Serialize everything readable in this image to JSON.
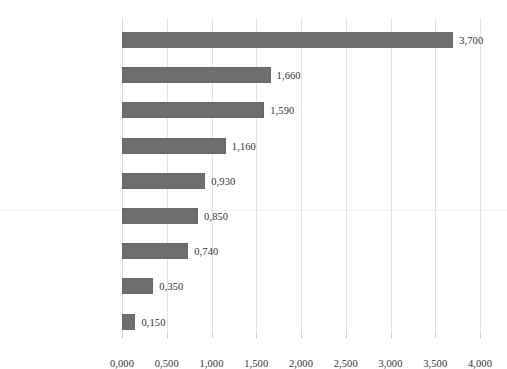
{
  "chart_data": {
    "type": "bar",
    "orientation": "horizontal",
    "title": "",
    "subtitle": "",
    "xlabel": "",
    "ylabel": "",
    "categories": [
      "Factories",
      "Cities",
      "Human",
      "Retail environments",
      "Worksites",
      "Outside",
      "Vehicles",
      "Home",
      "Officies"
    ],
    "values": [
      3.7,
      1.66,
      1.59,
      1.16,
      0.93,
      0.85,
      0.74,
      0.35,
      0.15
    ],
    "value_labels": [
      "3,700",
      "1,660",
      "1,590",
      "1,160",
      "0,930",
      "0,850",
      "0,740",
      "0,350",
      "0,150"
    ],
    "xlim": [
      0,
      4
    ],
    "xticks": [
      0,
      0.5,
      1,
      1.5,
      2,
      2.5,
      3,
      3.5,
      4
    ],
    "xtick_labels": [
      "0,000",
      "0,500",
      "1,000",
      "1,500",
      "2,000",
      "2,500",
      "3,000",
      "3,500",
      "4,000"
    ],
    "decimal_separator": ",",
    "grid": true,
    "grid_axis": "x",
    "legend": false,
    "legend_position": "none",
    "bar_color": "#6e6e6e",
    "gridline_color": "#e3e3e6",
    "text_color": "#2b2b2b"
  }
}
